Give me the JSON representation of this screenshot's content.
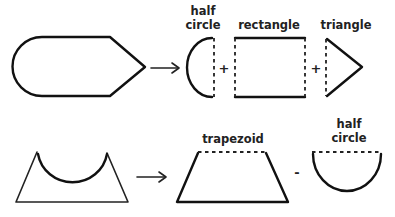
{
  "diagram": {
    "title": "",
    "row1": {
      "source_shape": "rounded-pentagon (half circle + rectangle + triangle)",
      "operator_1": "+",
      "operator_2": "+",
      "labels": {
        "half_circle_line1": "half",
        "half_circle_line2": "circle",
        "rectangle": "rectangle",
        "triangle": "triangle"
      }
    },
    "row2": {
      "source_shape": "trapezoid with semicircle cut-out",
      "operator": "-",
      "labels": {
        "trapezoid": "trapezoid",
        "half_circle_line1": "half",
        "half_circle_line2": "circle"
      }
    },
    "colors": {
      "stroke": "#111111",
      "background": "#ffffff"
    }
  }
}
